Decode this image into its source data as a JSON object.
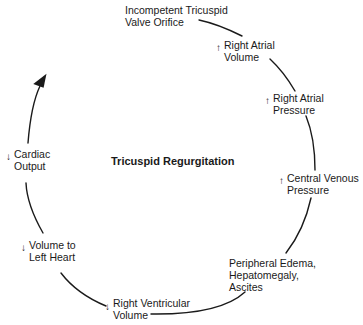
{
  "diagram": {
    "title": "Tricuspid Regurgitation",
    "type": "cycle",
    "nodes": [
      {
        "id": "n1",
        "lines": [
          "Incompetent Tricuspid",
          "Valve Orifice"
        ],
        "direction": ""
      },
      {
        "id": "n2",
        "lines": [
          "Right Atrial",
          "Volume"
        ],
        "direction": "↑"
      },
      {
        "id": "n3",
        "lines": [
          "Right Atrial",
          "Pressure"
        ],
        "direction": "↑"
      },
      {
        "id": "n4",
        "lines": [
          "Central Venous",
          "Pressure"
        ],
        "direction": "↑"
      },
      {
        "id": "n5",
        "lines": [
          "Peripheral Edema,",
          "Hepatomegaly,",
          "Ascites"
        ],
        "direction": ""
      },
      {
        "id": "n6",
        "lines": [
          "Right Ventricular",
          "Volume"
        ],
        "direction": "↓"
      },
      {
        "id": "n7",
        "lines": [
          "Volume to",
          "Left Heart"
        ],
        "direction": "↓"
      },
      {
        "id": "n8",
        "lines": [
          "Cardiac",
          "Output"
        ],
        "direction": "↓"
      }
    ],
    "line_color": "#1a1a1a"
  }
}
